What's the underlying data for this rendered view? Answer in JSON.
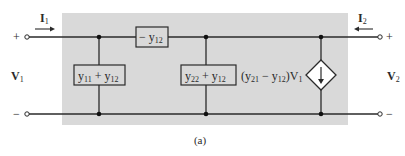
{
  "diagram": {
    "caption": "(a)",
    "colors": {
      "background": "#ffffff",
      "shaded_region": "#d9d9d9",
      "wire": "#2a2a2a",
      "component_fill": "#d9d9d9"
    },
    "port1": {
      "current_label": "I",
      "current_sub": "1",
      "voltage_label": "V",
      "voltage_sub": "1",
      "plus": "+",
      "minus": "−"
    },
    "port2": {
      "current_label": "I",
      "current_sub": "2",
      "voltage_label": "V",
      "voltage_sub": "2",
      "plus": "+",
      "minus": "−"
    },
    "components": {
      "series": {
        "prefix": "− y",
        "sub": "12"
      },
      "shunt_left": {
        "a": "y",
        "a_sub": "11",
        "op": " + y",
        "b_sub": "12"
      },
      "shunt_mid": {
        "a": "y",
        "a_sub": "22",
        "op": " + y",
        "b_sub": "12"
      },
      "dependent_source": {
        "open": "(y",
        "sub1": "21",
        "mid": " − y",
        "sub2": "12",
        "close": ")V",
        "sub3": "1"
      }
    }
  }
}
